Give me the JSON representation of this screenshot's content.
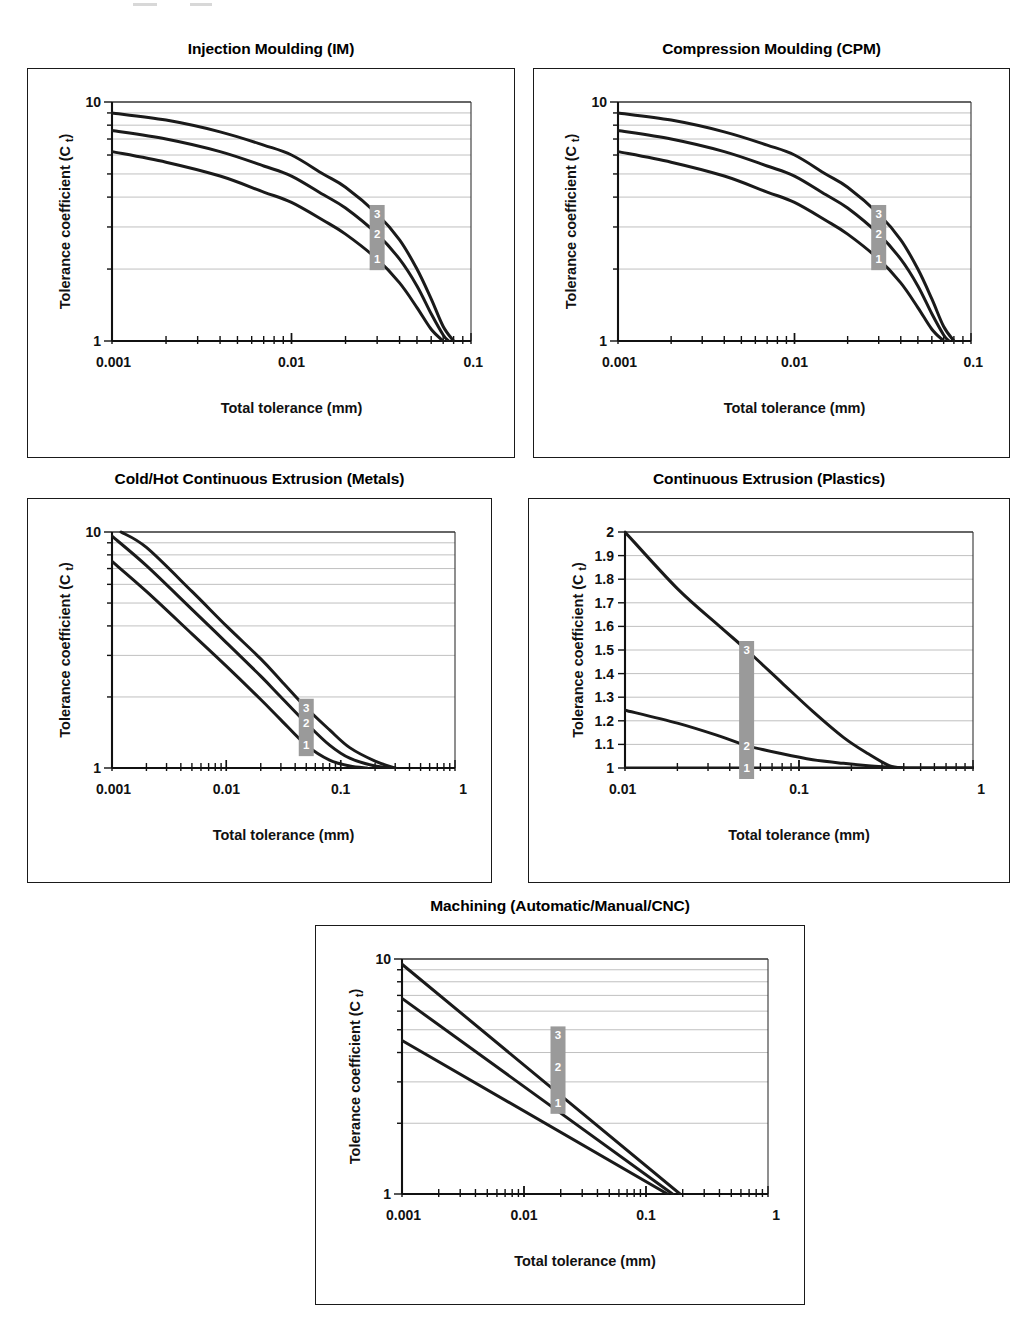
{
  "figure": {
    "background_color": "#ffffff",
    "line_color": "#1a1a1a",
    "grid_color": "#b9b9b9",
    "marker_box_color": "#9a9a9a",
    "marker_text_color": "#ffffff",
    "axis_x_title": "Total tolerance (mm)",
    "axis_y_title_main": "Tolerance coefficient (C",
    "axis_y_title_sub": "t",
    "axis_y_title_tail": ")",
    "series_labels": [
      "1",
      "2",
      "3"
    ]
  },
  "chart_data": [
    {
      "id": "injection-moulding",
      "type": "line",
      "title": "Injection Moulding (IM)",
      "xlabel": "Total tolerance (mm)",
      "ylabel": "Tolerance coefficient (C t)",
      "xscale": "log",
      "yscale": "log",
      "xlim": [
        0.001,
        0.1
      ],
      "ylim": [
        1,
        10
      ],
      "xticks": [
        0.001,
        0.01,
        0.1
      ],
      "xticklabels": [
        "0.001",
        "0.01",
        "0.1"
      ],
      "yticks": [
        1,
        10
      ],
      "yticklabels": [
        "1",
        "10"
      ],
      "ygridlines": [
        2,
        3,
        4,
        5,
        6,
        7,
        8,
        9
      ],
      "grid": true,
      "legend": "inline-markers",
      "marker_x": 0.03,
      "series": [
        {
          "name": "1",
          "x": [
            0.001,
            0.002,
            0.004,
            0.007,
            0.01,
            0.015,
            0.02,
            0.03,
            0.04,
            0.05,
            0.06,
            0.07
          ],
          "values": [
            6.2,
            5.6,
            4.9,
            4.2,
            3.8,
            3.2,
            2.8,
            2.2,
            1.75,
            1.38,
            1.12,
            1.0
          ]
        },
        {
          "name": "2",
          "x": [
            0.001,
            0.002,
            0.004,
            0.007,
            0.01,
            0.015,
            0.02,
            0.03,
            0.04,
            0.05,
            0.06,
            0.07,
            0.075
          ],
          "values": [
            7.6,
            7.0,
            6.2,
            5.4,
            4.9,
            4.1,
            3.6,
            2.8,
            2.2,
            1.7,
            1.3,
            1.06,
            1.0
          ]
        },
        {
          "name": "3",
          "x": [
            0.001,
            0.002,
            0.004,
            0.007,
            0.01,
            0.015,
            0.02,
            0.03,
            0.04,
            0.05,
            0.06,
            0.07,
            0.08
          ],
          "values": [
            9.0,
            8.4,
            7.5,
            6.6,
            6.0,
            5.0,
            4.4,
            3.4,
            2.65,
            2.0,
            1.5,
            1.15,
            1.0
          ]
        }
      ]
    },
    {
      "id": "compression-moulding",
      "type": "line",
      "title": "Compression Moulding (CPM)",
      "xlabel": "Total tolerance (mm)",
      "ylabel": "Tolerance coefficient (C t)",
      "xscale": "log",
      "yscale": "log",
      "xlim": [
        0.001,
        0.1
      ],
      "ylim": [
        1,
        10
      ],
      "xticks": [
        0.001,
        0.01,
        0.1
      ],
      "xticklabels": [
        "0.001",
        "0.01",
        "0.1"
      ],
      "yticks": [
        1,
        10
      ],
      "yticklabels": [
        "1",
        "10"
      ],
      "ygridlines": [
        2,
        3,
        4,
        5,
        6,
        7,
        8,
        9
      ],
      "grid": true,
      "legend": "inline-markers",
      "marker_x": 0.03,
      "series": [
        {
          "name": "1",
          "x": [
            0.001,
            0.002,
            0.004,
            0.007,
            0.01,
            0.015,
            0.02,
            0.03,
            0.04,
            0.05,
            0.06,
            0.07
          ],
          "values": [
            6.2,
            5.6,
            4.9,
            4.2,
            3.8,
            3.2,
            2.8,
            2.2,
            1.75,
            1.38,
            1.12,
            1.0
          ]
        },
        {
          "name": "2",
          "x": [
            0.001,
            0.002,
            0.004,
            0.007,
            0.01,
            0.015,
            0.02,
            0.03,
            0.04,
            0.05,
            0.06,
            0.07,
            0.075
          ],
          "values": [
            7.6,
            7.0,
            6.2,
            5.4,
            4.9,
            4.1,
            3.6,
            2.8,
            2.2,
            1.7,
            1.3,
            1.06,
            1.0
          ]
        },
        {
          "name": "3",
          "x": [
            0.001,
            0.002,
            0.004,
            0.007,
            0.01,
            0.015,
            0.02,
            0.03,
            0.04,
            0.05,
            0.06,
            0.07,
            0.08
          ],
          "values": [
            9.0,
            8.4,
            7.5,
            6.6,
            6.0,
            5.0,
            4.4,
            3.4,
            2.65,
            2.0,
            1.5,
            1.15,
            1.0
          ]
        }
      ]
    },
    {
      "id": "continuous-extrusion-metals",
      "type": "line",
      "title": "Cold/Hot Continuous Extrusion (Metals)",
      "xlabel": "Total tolerance (mm)",
      "ylabel": "Tolerance coefficient (C t)",
      "xscale": "log",
      "yscale": "log",
      "xlim": [
        0.001,
        1
      ],
      "ylim": [
        1,
        10
      ],
      "xticks": [
        0.001,
        0.01,
        0.1,
        1
      ],
      "xticklabels": [
        "0.001",
        "0.01",
        "0.1",
        "1"
      ],
      "yticks": [
        1,
        10
      ],
      "yticklabels": [
        "1",
        "10"
      ],
      "ygridlines": [
        2,
        3,
        4,
        5,
        6,
        7,
        8,
        9
      ],
      "grid": true,
      "legend": "inline-markers",
      "marker_x": 0.05,
      "series": [
        {
          "name": "1",
          "x": [
            0.001,
            0.002,
            0.005,
            0.01,
            0.02,
            0.03,
            0.05,
            0.08,
            0.12,
            0.17
          ],
          "values": [
            7.5,
            5.6,
            3.7,
            2.7,
            1.95,
            1.6,
            1.25,
            1.08,
            1.02,
            1.0
          ]
        },
        {
          "name": "2",
          "x": [
            0.001,
            0.002,
            0.005,
            0.01,
            0.02,
            0.03,
            0.05,
            0.08,
            0.12,
            0.2,
            0.3
          ],
          "values": [
            9.6,
            7.2,
            4.7,
            3.4,
            2.45,
            2.0,
            1.55,
            1.25,
            1.1,
            1.02,
            1.0
          ]
        },
        {
          "name": "3",
          "x": [
            0.0012,
            0.002,
            0.005,
            0.01,
            0.02,
            0.03,
            0.05,
            0.08,
            0.12,
            0.2,
            0.3
          ],
          "values": [
            10.0,
            8.6,
            5.6,
            4.0,
            2.9,
            2.35,
            1.8,
            1.45,
            1.22,
            1.07,
            1.0
          ]
        }
      ]
    },
    {
      "id": "continuous-extrusion-plastics",
      "type": "line",
      "title": "Continuous Extrusion (Plastics)",
      "xlabel": "Total tolerance (mm)",
      "ylabel": "Tolerance coefficient (C t)",
      "xscale": "log",
      "yscale": "linear",
      "xlim": [
        0.01,
        1
      ],
      "ylim": [
        1,
        2
      ],
      "xticks": [
        0.01,
        0.1,
        1
      ],
      "xticklabels": [
        "0.01",
        "0.1",
        "1"
      ],
      "yticks": [
        1,
        1.1,
        1.2,
        1.3,
        1.4,
        1.5,
        1.6,
        1.7,
        1.8,
        1.9,
        2
      ],
      "yticklabels": [
        "1",
        "1.1",
        "1.2",
        "1.3",
        "1.4",
        "1.5",
        "1.6",
        "1.7",
        "1.8",
        "1.9",
        "2"
      ],
      "ygridlines": [
        1.1,
        1.2,
        1.3,
        1.4,
        1.5,
        1.6,
        1.7,
        1.8,
        1.9
      ],
      "grid": true,
      "legend": "inline-markers",
      "marker_x": 0.05,
      "series": [
        {
          "name": "1",
          "x": [
            0.01,
            1
          ],
          "values": [
            1.0,
            1.0
          ]
        },
        {
          "name": "2",
          "x": [
            0.01,
            0.02,
            0.035,
            0.05,
            0.08,
            0.12,
            0.18,
            0.25,
            0.33,
            0.4,
            0.6,
            1.0
          ],
          "values": [
            1.245,
            1.19,
            1.135,
            1.095,
            1.06,
            1.035,
            1.02,
            1.01,
            1.004,
            1.0,
            1.0,
            1.0
          ]
        },
        {
          "name": "3",
          "x": [
            0.01,
            0.02,
            0.035,
            0.05,
            0.08,
            0.12,
            0.18,
            0.25,
            0.33,
            0.4
          ],
          "values": [
            2.0,
            1.76,
            1.6,
            1.5,
            1.36,
            1.24,
            1.13,
            1.06,
            1.01,
            1.0
          ]
        }
      ]
    },
    {
      "id": "machining",
      "type": "line",
      "title": "Machining (Automatic/Manual/CNC)",
      "xlabel": "Total tolerance (mm)",
      "ylabel": "Tolerance coefficient (C t)",
      "xscale": "log",
      "yscale": "log",
      "xlim": [
        0.001,
        1
      ],
      "ylim": [
        1,
        10
      ],
      "xticks": [
        0.001,
        0.01,
        0.1,
        1
      ],
      "xticklabels": [
        "0.001",
        "0.01",
        "0.1",
        "1"
      ],
      "yticks": [
        1,
        10
      ],
      "yticklabels": [
        "1",
        "10"
      ],
      "ygridlines": [
        2,
        3,
        4,
        5,
        6,
        7,
        8,
        9
      ],
      "grid": true,
      "legend": "inline-markers",
      "marker_x": 0.019,
      "series": [
        {
          "name": "1",
          "x": [
            0.001,
            0.15
          ],
          "values": [
            4.5,
            1.0
          ]
        },
        {
          "name": "2",
          "x": [
            0.001,
            0.165
          ],
          "values": [
            6.8,
            1.0
          ]
        },
        {
          "name": "3",
          "x": [
            0.001,
            0.19
          ],
          "values": [
            9.5,
            1.0
          ]
        }
      ]
    }
  ]
}
